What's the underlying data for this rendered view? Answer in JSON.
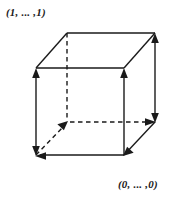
{
  "figure": {
    "type": "cube-diagram",
    "width": 188,
    "height": 201,
    "background_color": "#ffffff",
    "stroke_color": "#1a1a1a",
    "labels": {
      "top_left": "(1, ... ,1)",
      "bottom_right": "(0, ... ,0)"
    },
    "geometry": {
      "vertices": {
        "back_top_left": [
          67,
          33
        ],
        "back_top_right": [
          155,
          33
        ],
        "front_top_left": [
          36,
          68
        ],
        "front_top_right": [
          124,
          68
        ],
        "back_bottom_left": [
          67,
          122
        ],
        "back_bottom_right": [
          155,
          122
        ],
        "front_bottom_left": [
          36,
          155
        ],
        "front_bottom_right": [
          124,
          155
        ]
      },
      "solid_edges": [
        "back_top_left-back_top_right",
        "back_top_left-front_top_left",
        "back_top_right-front_top_right",
        "front_top_left-front_top_right",
        "front_top_left-front_bottom_left",
        "front_top_right-front_bottom_right",
        "back_top_right-back_bottom_right",
        "front_bottom_left-front_bottom_right",
        "back_bottom_right-front_bottom_right"
      ],
      "dashed_edges": [
        "back_top_left-back_bottom_left",
        "back_bottom_left-back_bottom_right",
        "back_bottom_left-front_bottom_left"
      ],
      "arrowheads": [
        {
          "name": "up-arrow-front-left-edge",
          "at": [
            36,
            68
          ],
          "direction": "up"
        },
        {
          "name": "up-arrow-front-right-edge",
          "at": [
            124,
            68
          ],
          "direction": "up"
        },
        {
          "name": "up-arrow-back-right-edge",
          "at": [
            155,
            33
          ],
          "direction": "up"
        },
        {
          "name": "down-arrow-front-left-edge",
          "at": [
            36,
            155
          ],
          "direction": "down"
        },
        {
          "name": "down-arrow-back-right-edge",
          "at": [
            155,
            122
          ],
          "direction": "down"
        },
        {
          "name": "left-arrow-bottom-front-edge",
          "at": [
            36,
            155
          ],
          "direction": "left"
        },
        {
          "name": "right-arrow-back-bottom-dashed",
          "at": [
            155,
            122
          ],
          "direction": "right"
        },
        {
          "name": "up-right-arrow-hidden-diagonal",
          "at": [
            67,
            122
          ],
          "direction": "up-right"
        },
        {
          "name": "down-left-arrow-front-bottom-right",
          "at": [
            124,
            155
          ],
          "direction": "down-left"
        }
      ]
    }
  }
}
